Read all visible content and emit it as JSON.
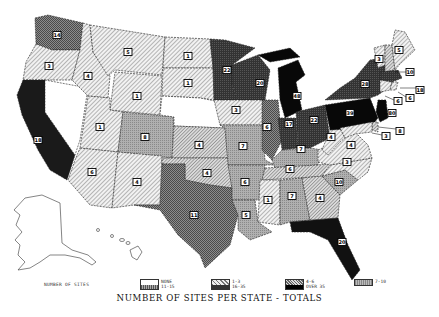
{
  "title": "NUMBER OF SITES PER STATE - TOTALS",
  "legend": {
    "caption": "NUMBER OF SITES",
    "items": [
      {
        "top": "NONE",
        "bottom": "11-15"
      },
      {
        "top": "1-3",
        "bottom": "16-35"
      },
      {
        "top": "4-6",
        "bottom": "OVER 35"
      },
      {
        "top": "7-10",
        "bottom": ""
      }
    ]
  },
  "colors": {
    "none": "#ffffff",
    "c1_3": "#e2e2e2",
    "c4_6": "#c4c4c4",
    "c7_10": "#a6a6a6",
    "c11_15": "#7c7c7c",
    "c16_35": "#3a3a3a",
    "over35": "#080808"
  },
  "states": {
    "WA": "14",
    "OR": "3",
    "CA": "18",
    "NV": "",
    "ID": "4",
    "MT": "5",
    "WY": "1",
    "UT": "1",
    "CO": "8",
    "AZ": "6",
    "NM": "4",
    "ND": "1",
    "SD": "1",
    "NE": "",
    "KS": "4",
    "OK": "4",
    "TX": "11",
    "MN": "22",
    "IA": "3",
    "MO": "7",
    "AR": "6",
    "LA": "5",
    "WI": "20",
    "IL": "6",
    "MI": "48",
    "IN": "17",
    "OH": "22",
    "KY": "7",
    "TN": "6",
    "MS": "1",
    "AL": "7",
    "GA": "4",
    "FL": "20",
    "SC": "10",
    "NC": "3",
    "VA": "4",
    "WV": "4",
    "PA": "39",
    "NY": "28",
    "ME": "5",
    "VT": "3",
    "NH": "10",
    "MA": "18",
    "RI": "6",
    "CT": "6",
    "NJ": "80",
    "DE": "8",
    "MD": "3",
    "AK": "",
    "HI": ""
  }
}
